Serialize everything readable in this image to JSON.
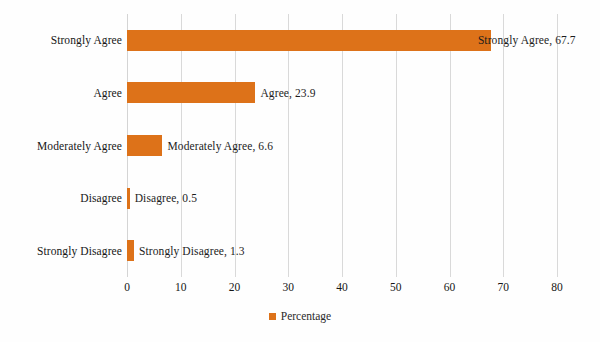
{
  "chart_data": {
    "type": "bar",
    "orientation": "horizontal",
    "title": "",
    "xlabel": "",
    "ylabel": "",
    "categories": [
      "Strongly Agree",
      "Agree",
      "Moderately Agree",
      "Disagree",
      "Strongly Disagree"
    ],
    "values": [
      67.7,
      23.9,
      6.6,
      0.5,
      1.3
    ],
    "data_labels": [
      "Strongly Agree, 67.7",
      "Agree, 23.9",
      "Moderately Agree, 6.6",
      "Disagree, 0.5",
      "Strongly Disagree, 1.3"
    ],
    "series": [
      {
        "name": "Percentage",
        "values": [
          67.7,
          23.9,
          6.6,
          0.5,
          1.3
        ]
      }
    ],
    "xlim": [
      0,
      80
    ],
    "xticks": [
      0,
      10,
      20,
      30,
      40,
      50,
      60,
      70,
      80
    ],
    "xtick_labels": [
      "0",
      "10",
      "20",
      "30",
      "40",
      "50",
      "60",
      "70",
      "80"
    ],
    "grid": true,
    "grid_axis": "x",
    "legend": {
      "position": "bottom",
      "entries": [
        {
          "label": "Percentage",
          "color": "#dd7219",
          "marker": "square"
        }
      ]
    },
    "colors": {
      "bar": "#dd7219",
      "gridline": "#d9d9d9",
      "text": "#161616",
      "background": "#fefefe"
    }
  }
}
